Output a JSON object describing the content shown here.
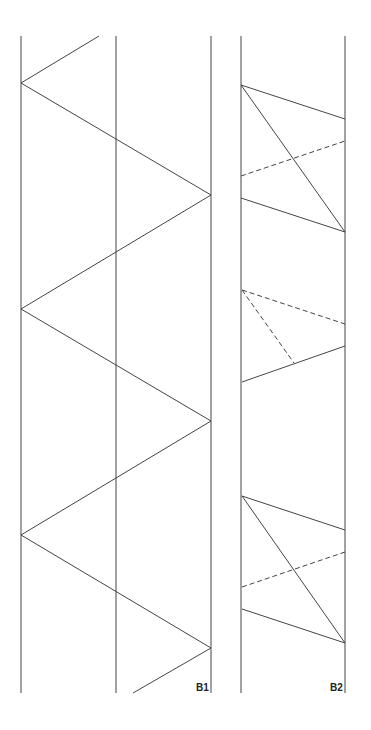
{
  "panels": [
    {
      "id": "B1",
      "label": "B1",
      "description": "Single zigzag between two outer rails crossing a center rail",
      "rails": 3,
      "pattern": "zigzag"
    },
    {
      "id": "B2",
      "label": "B2",
      "description": "Repeating units of solid and dashed diagonals between two rails",
      "rails": 2,
      "units": [
        {
          "type": "full",
          "solid_segments": 3,
          "dashed_segments": 1
        },
        {
          "type": "partial",
          "solid_segments": 1,
          "dashed_segments": 2
        },
        {
          "type": "full",
          "solid_segments": 3,
          "dashed_segments": 1
        }
      ]
    }
  ],
  "colors": {
    "line": "#444444",
    "background": "#ffffff"
  }
}
